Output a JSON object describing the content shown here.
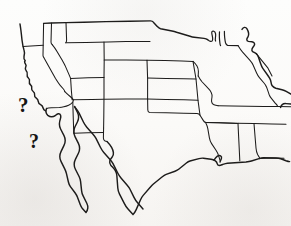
{
  "page": {
    "kind": "scanned-map-figure",
    "background_color": "#fbfaf8",
    "ink_color": "#1d1c1b",
    "width": 291,
    "height": 226
  },
  "map": {
    "name": "united-states-outline-map",
    "description": "Hand-drawn style outline map of the contiguous United States with state borders, Baja California peninsula and northern Mexico coastline",
    "coastline_color": "#1d1c1b",
    "border_color": "#1d1c1b"
  },
  "annotations": {
    "markers": [
      {
        "name": "question-mark-upper",
        "label": "?",
        "x": 18,
        "y": 95
      },
      {
        "name": "question-mark-lower",
        "label": "?",
        "x": 29,
        "y": 131
      }
    ]
  },
  "ghost_text": {
    "note": "faint illegible bleed-through from reverse side of page",
    "line_1": "",
    "line_2": ""
  }
}
